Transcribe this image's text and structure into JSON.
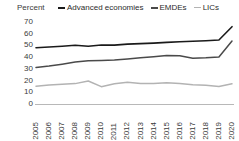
{
  "chart_data": {
    "type": "line",
    "title": "",
    "subtitle": "",
    "xlabel": "",
    "ylabel": "Percent",
    "ylim": [
      0,
      70
    ],
    "yticks": [
      0,
      10,
      20,
      30,
      40,
      50,
      60,
      70
    ],
    "grid": false,
    "legend_position": "top",
    "categories": [
      "2005",
      "2006",
      "2007",
      "2008",
      "2009",
      "2010",
      "2011",
      "2012",
      "2013",
      "2014",
      "2015",
      "2016",
      "2017",
      "2018",
      "2019",
      "2020"
    ],
    "x": [
      2005,
      2006,
      2007,
      2008,
      2009,
      2010,
      2011,
      2012,
      2013,
      2014,
      2015,
      2016,
      2017,
      2018,
      2019,
      2020
    ],
    "series": [
      {
        "name": "Advanced economies",
        "color": "#1a1a1a",
        "width": 1.6,
        "values": [
          48,
          48.6,
          49.3,
          50.2,
          49.3,
          50.4,
          50.3,
          51.1,
          51.5,
          52.0,
          52.6,
          53.2,
          53.6,
          54.0,
          54.6,
          66.0
        ]
      },
      {
        "name": "EMDEs",
        "color": "#4a4a4a",
        "width": 1.5,
        "values": [
          31.2,
          32.4,
          34.0,
          35.8,
          37.0,
          37.2,
          37.6,
          38.4,
          39.4,
          40.4,
          41.4,
          41.2,
          39.0,
          39.4,
          40.2,
          53.8
        ]
      },
      {
        "name": "LICs",
        "color": "#b3b3b3",
        "width": 1.5,
        "values": [
          15.2,
          16.2,
          16.8,
          17.4,
          19.6,
          14.8,
          17.2,
          18.6,
          17.6,
          17.4,
          18.1,
          17.4,
          16.4,
          16.0,
          15.0,
          17.2
        ]
      }
    ]
  },
  "legend": {
    "items": [
      {
        "label": "Advanced economies",
        "color": "#1a1a1a"
      },
      {
        "label": "EMDEs",
        "color": "#4a4a4a"
      },
      {
        "label": "LICs",
        "color": "#b3b3b3"
      }
    ]
  },
  "axes": {
    "y_title": "Percent"
  }
}
